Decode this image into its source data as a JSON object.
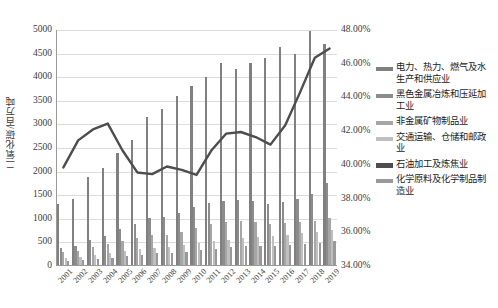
{
  "chart_data": {
    "type": "bar",
    "title": "",
    "subtitle": "",
    "xlabel": "",
    "ylabel": "二氧化碳/百万吨",
    "y2label": "",
    "grid": true,
    "legend_position": "right",
    "ylim": [
      0,
      5000
    ],
    "y2lim": [
      0.34,
      0.48
    ],
    "yticks": [
      "0",
      "500",
      "1000",
      "1500",
      "2000",
      "2500",
      "3000",
      "3500",
      "4000",
      "4500",
      "5000"
    ],
    "ytick_values": [
      0,
      500,
      1000,
      1500,
      2000,
      2500,
      3000,
      3500,
      4000,
      4500,
      5000
    ],
    "y2ticks": [
      "34.00%",
      "36.00%",
      "38.00%",
      "40.00%",
      "42.00%",
      "44.00%",
      "46.00%",
      "48.00%"
    ],
    "y2tick_values": [
      0.34,
      0.36,
      0.38,
      0.4,
      0.42,
      0.44,
      0.46,
      0.48
    ],
    "categories": [
      "2001",
      "2002",
      "2003",
      "2004",
      "2005",
      "2006",
      "2007",
      "2008",
      "2009",
      "2010",
      "2011",
      "2012",
      "2013",
      "2014",
      "2015",
      "2016",
      "2017",
      "2018",
      "2019"
    ],
    "series": [
      {
        "name": "电力、热力、燃气及水生产和供应业",
        "axis": "left",
        "kind": "bar",
        "color": "#808080",
        "values": [
          1320,
          1430,
          1880,
          2070,
          2400,
          2680,
          3150,
          3330,
          3600,
          3820,
          4000,
          4300,
          4180,
          4300,
          4400,
          4650,
          4500,
          4980,
          4700
        ]
      },
      {
        "name": "黑色金属冶炼和压延加工业",
        "axis": "left",
        "kind": "bar",
        "color": "#8c8c8c",
        "values": [
          390,
          430,
          560,
          640,
          780,
          900,
          1010,
          1030,
          1120,
          1250,
          1340,
          1380,
          1400,
          1380,
          1320,
          1360,
          1420,
          1520,
          1760
        ]
      },
      {
        "name": "非金属矿物制品业",
        "axis": "left",
        "kind": "bar",
        "color": "#a6a6a6",
        "values": [
          300,
          320,
          400,
          460,
          520,
          590,
          650,
          660,
          720,
          800,
          880,
          930,
          960,
          940,
          900,
          920,
          930,
          950,
          1010
        ]
      },
      {
        "name": "交通运输、仓储和邮政业",
        "axis": "left",
        "kind": "bar",
        "color": "#bfbfbf",
        "values": [
          180,
          200,
          230,
          270,
          310,
          350,
          390,
          410,
          450,
          490,
          530,
          560,
          590,
          610,
          630,
          660,
          690,
          720,
          760
        ]
      },
      {
        "name": "化学原料及化学制品制造业",
        "axis": "left",
        "kind": "bar",
        "color": "#999999",
        "values": [
          110,
          120,
          150,
          175,
          210,
          240,
          270,
          280,
          300,
          340,
          370,
          400,
          420,
          430,
          430,
          450,
          460,
          480,
          520
        ]
      },
      {
        "name": "石油加工及炼焦业",
        "axis": "right",
        "kind": "line",
        "color": "#4d4d4d",
        "values": [
          0.3985,
          0.4145,
          0.421,
          0.4245,
          0.4085,
          0.3955,
          0.3945,
          0.399,
          0.397,
          0.394,
          0.4085,
          0.4185,
          0.4195,
          0.4165,
          0.412,
          0.4235,
          0.443,
          0.4635,
          0.469
        ]
      }
    ]
  },
  "legend": {
    "items": [
      {
        "label": "电力、热力、燃气及水生产和供应业",
        "color": "#808080",
        "style": "bar"
      },
      {
        "label": "黑色金属冶炼和压延加工业",
        "color": "#8c8c8c",
        "style": "bar"
      },
      {
        "label": "非金属矿物制品业",
        "color": "#a6a6a6",
        "style": "bar"
      },
      {
        "label": "交通运输、仓储和邮政业",
        "color": "#bfbfbf",
        "style": "bar"
      },
      {
        "label": "石油加工及炼焦业",
        "color": "#4d4d4d",
        "style": "line"
      },
      {
        "label": "化学原料及化学制品制造业",
        "color": "#999999",
        "style": "bar"
      }
    ]
  },
  "axes": {
    "left_title": "二氧化碳/百万吨"
  }
}
